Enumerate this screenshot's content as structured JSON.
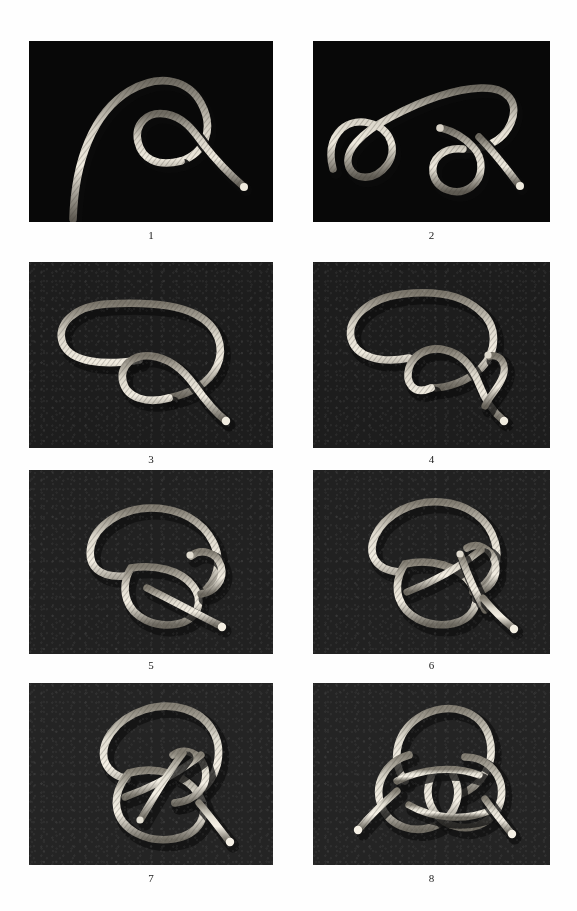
{
  "page": {
    "background_color": "#fefefe",
    "panel_count": 8,
    "columns": 2,
    "rows": 4
  },
  "colors": {
    "sheet": "#fefefe",
    "panel_black": "#090909",
    "panel_felt_dark": "#1f1f1f",
    "panel_felt_mid": "#2b2b2b",
    "rope_light": "#e6e2d8",
    "rope_mid": "#b9b3a6",
    "rope_shadow": "#6d685e",
    "caption_text": "#1a1a1a"
  },
  "panels": [
    {
      "id": "panel-1",
      "caption": "1",
      "background": "black",
      "alt": "A single light rope curving from lower-left up over the top and down into a simple open overhand loop at the right, working end pointing to lower right",
      "step_description": "Form a loop in the rope"
    },
    {
      "id": "panel-2",
      "caption": "2",
      "background": "black",
      "alt": "Rope with a bight formed at the left and a crossed loop at the right, working end passing out to the lower right",
      "step_description": "Bring the standing part around to make a second bight"
    },
    {
      "id": "panel-3",
      "caption": "3",
      "background": "felt",
      "alt": "Long flat bight at the left joined to a round loop at the lower right with the working end crossing through and exiting right",
      "step_description": "Lay the bight across the loop"
    },
    {
      "id": "panel-4",
      "caption": "4",
      "background": "felt",
      "alt": "Bight looped over, with the working end tucked back through the round loop and the tip showing at the right side",
      "step_description": "Tuck the working end through the loop"
    },
    {
      "id": "panel-5",
      "caption": "5",
      "background": "felt",
      "alt": "Knot tightening: large upper bight with the loop crossing diagonally and the working end passing behind and out to the lower right",
      "step_description": "Pass the end around behind the standing part"
    },
    {
      "id": "panel-6",
      "caption": "6",
      "background": "felt",
      "alt": "More interwoven knot with both ends crossing the centre and two short tails showing at the right",
      "step_description": "Weave the end back over and under"
    },
    {
      "id": "panel-7",
      "caption": "7",
      "background": "felt",
      "alt": "Nearly complete decorative knot with a top bight, interlaced centre and two tails at the lower right",
      "step_description": "Follow the lead around a second time"
    },
    {
      "id": "panel-8",
      "caption": "8",
      "background": "felt",
      "alt": "Finished symmetrical three-lobed decorative knot with both working ends emerging at bottom left and bottom right",
      "step_description": "Dress and tighten the finished knot"
    }
  ]
}
